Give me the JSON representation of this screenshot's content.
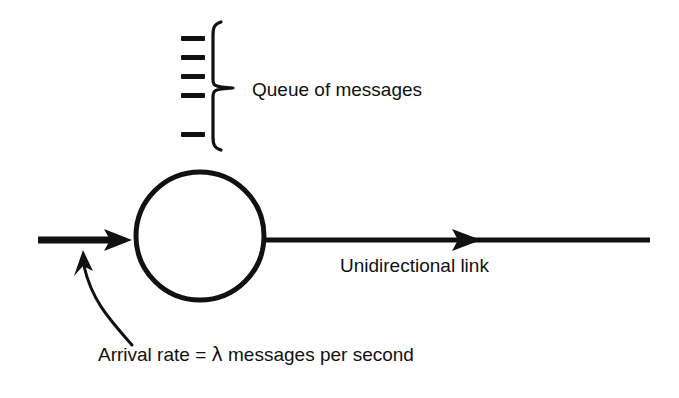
{
  "figure": {
    "type": "diagram",
    "background_color": "#ffffff",
    "ink_color": "#111111",
    "width": 679,
    "height": 398
  },
  "labels": {
    "queue": "Queue of messages",
    "link": "Unidirectional link",
    "arrival_prefix": "Arrival rate = ",
    "arrival_symbol": "λ",
    "arrival_suffix": " messages per second",
    "arrival_full": "Arrival rate = λ messages per second"
  },
  "queue": {
    "message_count": 5,
    "dash_width": 24,
    "dash_thickness": 5,
    "dash_x": 181,
    "dash_y_positions": [
      38,
      57,
      76,
      95,
      134
    ],
    "brace": {
      "top_y": 22,
      "bottom_y": 150,
      "left_x": 213,
      "tip_x": 233,
      "mid_y": 88
    }
  },
  "node": {
    "shape": "circle",
    "center_x": 200,
    "center_y": 236,
    "radius_x": 64,
    "radius_y": 64,
    "stroke_width": 5
  },
  "arrows": {
    "inbound": {
      "name": "arrival-arrow",
      "x_start": 38,
      "x_end": 130,
      "y": 240,
      "thickness": 7,
      "head_length": 26,
      "head_half_height": 11
    },
    "outbound": {
      "name": "departure-link",
      "x_start": 264,
      "x_end": 650,
      "y": 240,
      "thickness": 5,
      "head_x": 480,
      "head_length": 28,
      "head_half_height": 11
    },
    "curved_pointer": {
      "name": "arrival-rate-pointer",
      "tip_x": 82,
      "tip_y": 252,
      "tail_x": 130,
      "tail_y": 345
    }
  },
  "text_positions": {
    "queue_label_x": 252,
    "queue_label_y": 96,
    "link_label_x": 340,
    "link_label_y": 272,
    "arrival_label_x": 98,
    "arrival_label_y": 361
  }
}
